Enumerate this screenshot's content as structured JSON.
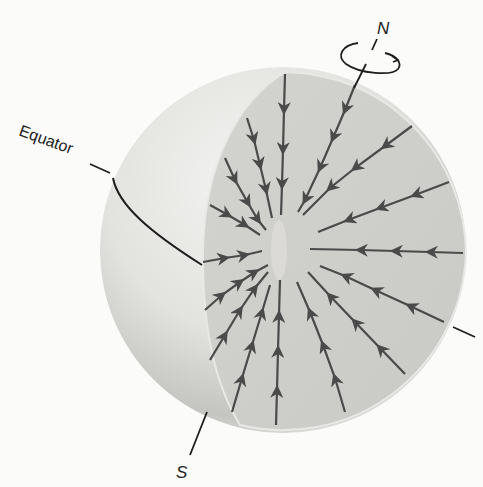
{
  "diagram": {
    "labels": {
      "north": "N",
      "south": "S",
      "equator": "Equator"
    },
    "colors": {
      "background": "#fbfbf9",
      "sphere_light": "#ededeb",
      "sphere_dark": "#b9b9b6",
      "cut_face": "#cfcfcc",
      "arrow": "#4a4a4a",
      "line": "#1e1e1e"
    },
    "elements": {
      "rotation_arrow": "rotation-icon",
      "flow_arrows_count": 17,
      "flow_direction": "inward toward center"
    }
  }
}
